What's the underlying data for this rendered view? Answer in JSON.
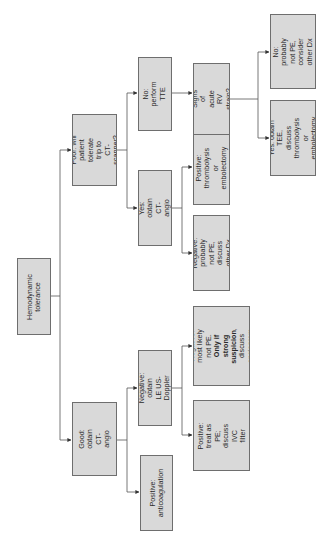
{
  "diagram": {
    "orientation": "rotated-90-ccw",
    "colors": {
      "box_fill": "#d9d9d9",
      "box_border": "#6e6e6e",
      "line": "#555555",
      "text": "#2a2a2a"
    },
    "nodes": {
      "root": {
        "label": "Hemodynamic\ntolerance"
      },
      "poor": {
        "label": "Poor: will\npatient tolerate\ntrip to CT-\nscanner?"
      },
      "good": {
        "label": "Good: obtain\nCT-angio"
      },
      "poor_yes": {
        "label": "Yes: obtain CT-\nangio"
      },
      "poor_no": {
        "label": "No: perform\nTTE"
      },
      "good_negative": {
        "label": "Negative: obtain\nLE US-Doppler"
      },
      "good_positive": {
        "label": "Positive:\nanticoagulation"
      },
      "yes_positive": {
        "label": "Positive:\nthrombolysis or\nembolectomy"
      },
      "yes_negative": {
        "label": "Negative:\nprobably not PE,\ndiscuss other Dx"
      },
      "rv_strain": {
        "label": "Signs of acute\nRV strain?"
      },
      "doppler_negative": {
        "label_pre": "Negative:\nmost likely not PE.",
        "label_bold": "Only if strong\nsuspicion",
        "label_post": ", discuss\nangiogram"
      },
      "doppler_positive": {
        "label": "Positive: treat as\nPE; discuss\nIVC filter"
      },
      "rv_no": {
        "label": "No: probably\nnot PE, consider\nother Dx"
      },
      "rv_yes": {
        "label": "Yes: obtain TEE,\ndiscuss\nthrombolysis or\nembolectomy"
      }
    }
  }
}
